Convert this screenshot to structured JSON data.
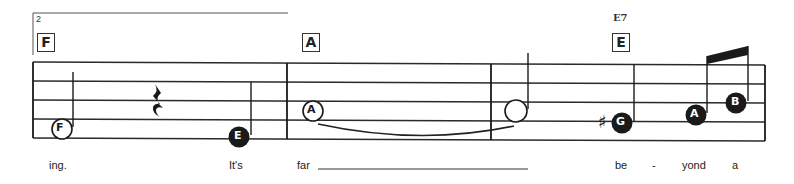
{
  "measure_number": "2",
  "chord_boxes": [
    {
      "letter": "F",
      "x": 37,
      "y": 33
    },
    {
      "letter": "A",
      "x": 302,
      "y": 33
    },
    {
      "letter": "E",
      "x": 612,
      "y": 33
    }
  ],
  "chord_names": [
    {
      "name": "E7",
      "x": 613,
      "y": 12
    }
  ],
  "notes": [
    {
      "letter": "F",
      "style": "open-letter",
      "cx": 62,
      "cy": 129,
      "stem": "up"
    },
    {
      "letter": "E",
      "style": "filled-letter",
      "cx": 239,
      "cy": 137,
      "stem": "up"
    },
    {
      "letter": "A",
      "style": "open-letter",
      "cx": 313,
      "cy": 111,
      "stem": "none"
    },
    {
      "letter": "",
      "style": "half-open",
      "cx": 516,
      "cy": 111,
      "stem": "up"
    },
    {
      "letter": "G",
      "style": "filled-letter",
      "accidental": "♯",
      "cx": 622,
      "cy": 123,
      "stem": "up"
    },
    {
      "letter": "A",
      "style": "filled-letter",
      "cx": 696,
      "cy": 115,
      "stem": "up-beamed"
    },
    {
      "letter": "B",
      "style": "filled-letter",
      "cx": 736,
      "cy": 103,
      "stem": "up-beamed"
    }
  ],
  "rests": [
    {
      "type": "quarter",
      "x": 157,
      "y": 99
    }
  ],
  "lyrics": [
    {
      "text": "ing.",
      "x": 49
    },
    {
      "text": "It's",
      "x": 229
    },
    {
      "text": "far",
      "x": 297
    },
    {
      "text": "be",
      "x": 615
    },
    {
      "text": "-",
      "x": 652
    },
    {
      "text": "yond",
      "x": 682
    },
    {
      "text": "a",
      "x": 732
    }
  ],
  "colors": {
    "ink": "#1a1a1a",
    "staff": "#2a2a2a",
    "paper": "#ffffff"
  }
}
